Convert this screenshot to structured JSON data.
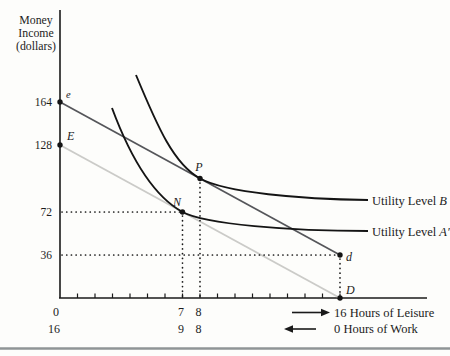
{
  "axis": {
    "y_title_lines": [
      "Money",
      "Income",
      "(dollars)"
    ],
    "y_tick_labels": [
      "164",
      "128",
      "72",
      "36"
    ],
    "leisure_row": {
      "t0": "0",
      "t7": "7",
      "t8": "8",
      "label": "16 Hours of Leisure"
    },
    "work_row": {
      "t16": "16",
      "t9": "9",
      "t8": "8",
      "label": "0 Hours of Work"
    }
  },
  "points": {
    "e": "e",
    "E": "E",
    "N": "N",
    "P": "P",
    "d": "d",
    "D": "D"
  },
  "curves": {
    "utility_prefix": "Utility Level ",
    "b_var": "B",
    "a_var": "A′"
  },
  "colors": {
    "curve": "#141414",
    "budget_ed_dark": "#55565a",
    "budget_ED_light": "#cbcbc8",
    "axis": "#1a1a1a",
    "dotted": "#1a1a1a",
    "bottom_rule": "#8f9496"
  },
  "chart_data": {
    "type": "line",
    "title": "",
    "ylabel": "Money Income (dollars)",
    "xlabel_primary": "Hours of Leisure (0 at origin to 16 at right)",
    "xlabel_secondary": "Hours of Work (16 at origin to 0 at right)",
    "xlim": [
      0,
      16
    ],
    "ylim": [
      0,
      190
    ],
    "grid": false,
    "y_ticks": [
      36,
      72,
      128,
      164
    ],
    "x_ticks_labeled": {
      "leisure": [
        0,
        7,
        8,
        16
      ],
      "work": [
        16,
        9,
        8,
        0
      ]
    },
    "series": [
      {
        "name": "Budget line e–d",
        "type": "line",
        "points": [
          {
            "leisure": 0,
            "income": 164
          },
          {
            "leisure": 16,
            "income": 36
          }
        ]
      },
      {
        "name": "Budget line E–D",
        "type": "line",
        "points": [
          {
            "leisure": 0,
            "income": 128
          },
          {
            "leisure": 16,
            "income": 0
          }
        ]
      },
      {
        "name": "Utility Level B",
        "type": "indifference_curve",
        "tangent_to": "Budget line e–d",
        "tangency": {
          "label": "P",
          "leisure": 8,
          "work": 8,
          "income": 100
        }
      },
      {
        "name": "Utility Level A′",
        "type": "indifference_curve",
        "tangent_to": "Budget line E–D",
        "tangency": {
          "label": "N",
          "leisure": 7,
          "work": 9,
          "income": 72
        }
      }
    ],
    "annotated_points": [
      {
        "label": "e",
        "leisure": 0,
        "income": 164
      },
      {
        "label": "E",
        "leisure": 0,
        "income": 128
      },
      {
        "label": "P",
        "leisure": 8,
        "income": 100
      },
      {
        "label": "N",
        "leisure": 7,
        "income": 72
      },
      {
        "label": "d",
        "leisure": 16,
        "income": 36
      },
      {
        "label": "D",
        "leisure": 16,
        "income": 0
      }
    ],
    "dotted_guides": [
      {
        "horizontal_at_income": 72,
        "from": "y-axis",
        "to_point": "N"
      },
      {
        "horizontal_at_income": 36,
        "from": "y-axis",
        "to_point": "d"
      },
      {
        "vertical_at_leisure": 7,
        "from_point": "N",
        "to": "x-axis"
      },
      {
        "vertical_at_leisure": 8,
        "from_point": "P",
        "to": "x-axis"
      },
      {
        "vertical_at_leisure": 16,
        "from_point": "d",
        "to_point": "D"
      }
    ]
  }
}
